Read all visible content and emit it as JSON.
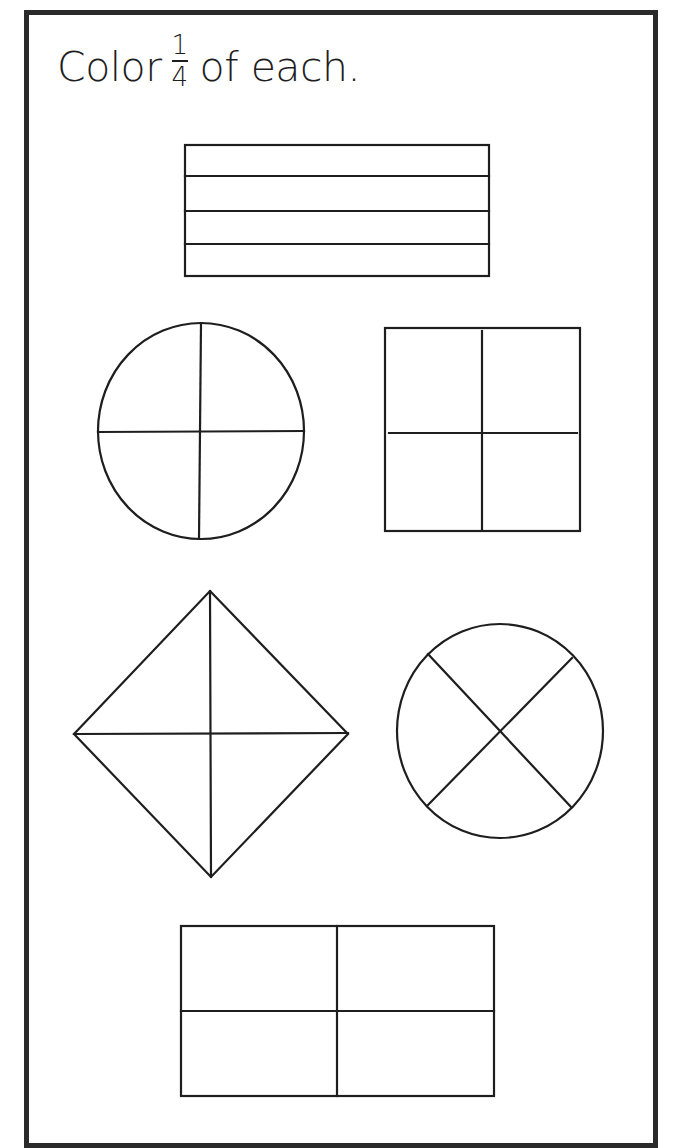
{
  "worksheet": {
    "instruction": {
      "prefix": "Color",
      "fraction": {
        "numerator": "1",
        "denominator": "4"
      },
      "suffix": "of each."
    },
    "colors": {
      "stroke": "#1e1e1e",
      "frame": "#2a2a2a",
      "background": "#ffffff"
    },
    "shapes": [
      {
        "id": "rectangle-horizontal-strips",
        "type": "rectangle",
        "parts": 4,
        "division": "horizontal-strips"
      },
      {
        "id": "circle-cross",
        "type": "circle",
        "parts": 4,
        "division": "plus"
      },
      {
        "id": "square-cross",
        "type": "square",
        "parts": 4,
        "division": "plus"
      },
      {
        "id": "diamond-cross",
        "type": "diamond",
        "parts": 4,
        "division": "plus"
      },
      {
        "id": "circle-x",
        "type": "circle",
        "parts": 4,
        "division": "diagonal-x"
      },
      {
        "id": "rectangle-quadrants",
        "type": "rectangle",
        "parts": 4,
        "division": "plus"
      }
    ]
  }
}
